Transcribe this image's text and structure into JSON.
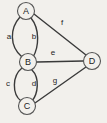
{
  "figure": {
    "kind": "undirected-multigraph-diagram",
    "background_color": "#f2f0ec",
    "line_color": "#3a3a3a",
    "node_fill_color": "#f2f0ec",
    "node_stroke_color": "#555555",
    "text_color": "#1d1d1d",
    "width": 107,
    "height": 123
  },
  "nodes": [
    {
      "id": "A",
      "label": "A",
      "cx": 26,
      "cy": 11,
      "r": 8.5
    },
    {
      "id": "B",
      "label": "B",
      "cx": 28,
      "cy": 62,
      "r": 8.5
    },
    {
      "id": "C",
      "label": "C",
      "cx": 27,
      "cy": 106,
      "r": 8.5
    },
    {
      "id": "D",
      "label": "D",
      "cx": 92,
      "cy": 61,
      "r": 8.5
    }
  ],
  "edges": [
    {
      "id": "a",
      "label": "a",
      "from": "A",
      "to": "B",
      "shape": "curve-left",
      "label_x": 9,
      "label_y": 36,
      "path": "M 20,17 C 10,28 9,46 22,57"
    },
    {
      "id": "b",
      "label": "b",
      "from": "A",
      "to": "B",
      "shape": "curve-right",
      "label_x": 34,
      "label_y": 36,
      "path": "M 31,18 C 40,29 39,47 33,57"
    },
    {
      "id": "c",
      "label": "c",
      "from": "B",
      "to": "C",
      "shape": "curve-left",
      "label_x": 8,
      "label_y": 83,
      "path": "M 22,68 C 12,76 12,94 21,101"
    },
    {
      "id": "d",
      "label": "d",
      "from": "B",
      "to": "C",
      "shape": "curve-right",
      "label_x": 34,
      "label_y": 83,
      "path": "M 32,70 C 40,78 38,94 32,101"
    },
    {
      "id": "e",
      "label": "e",
      "from": "B",
      "to": "D",
      "shape": "straight",
      "label_x": 53,
      "label_y": 52,
      "path": "M 37,62 L 83,61"
    },
    {
      "id": "f",
      "label": "f",
      "from": "A",
      "to": "D",
      "shape": "straight",
      "label_x": 62,
      "label_y": 22,
      "path": "M 34,14 L 86,55"
    },
    {
      "id": "g",
      "label": "g",
      "from": "C",
      "to": "D",
      "shape": "straight",
      "label_x": 55,
      "label_y": 80,
      "path": "M 35,103 L 86,67"
    }
  ],
  "legend": {
    "node_ids": [
      "A",
      "B",
      "C",
      "D"
    ],
    "edge_ids": [
      "a",
      "b",
      "c",
      "d",
      "e",
      "f",
      "g"
    ]
  }
}
